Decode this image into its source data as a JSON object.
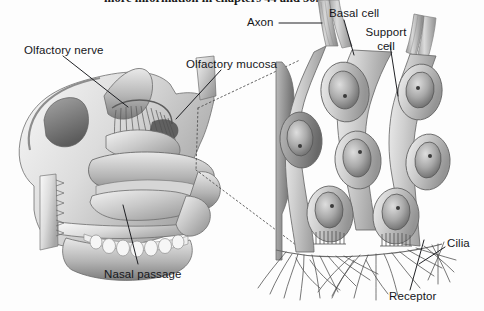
{
  "figure": {
    "title_partial": "more information in chapters 44 and 50.",
    "background_color": "#fdfdfd",
    "ink_color": "#15161a",
    "width": 484,
    "height": 311
  },
  "panels": {
    "left": {
      "name": "sagittal-nasal-cavity",
      "description": "Grayscale sagittal section of the human nasal cavity showing nasal septum, turbinates, olfactory bulb region, hard palate and upper teeth."
    },
    "right": {
      "name": "olfactory-epithelium-detail",
      "description": "Magnified grayscale drawing of olfactory epithelium: elongated support cells, basal cells, receptor neurons with nuclei, axons exiting the top and cilia extending at the bottom."
    },
    "connector": {
      "name": "magnification-cone",
      "style": "dotted"
    }
  },
  "labels": [
    {
      "id": "olfactory-nerve",
      "text": "Olfactory nerve",
      "x": 24,
      "y": 44
    },
    {
      "id": "olfactory-mucosa",
      "text": "Olfactory mucosa",
      "x": 186,
      "y": 58
    },
    {
      "id": "nasal-passage",
      "text": "Nasal passage",
      "x": 104,
      "y": 268
    },
    {
      "id": "axon",
      "text": "Axon",
      "x": 247,
      "y": 27
    },
    {
      "id": "basal-cell",
      "text": "Basal cell",
      "x": 329,
      "y": 7
    },
    {
      "id": "support-cell",
      "line1": "Support",
      "line2": "cell",
      "x": 360,
      "y": 26
    },
    {
      "id": "cilia",
      "text": "Cilia",
      "x": 447,
      "y": 243
    },
    {
      "id": "receptor",
      "text": "Receptor",
      "x": 389,
      "y": 296
    }
  ],
  "leader_lines": [
    {
      "id": "leader-olfactory-nerve",
      "from": [
        63,
        56
      ],
      "to": [
        128,
        107
      ]
    },
    {
      "id": "leader-olfactory-mucosa",
      "from": [
        221,
        70
      ],
      "to": [
        176,
        119
      ]
    },
    {
      "id": "leader-nasal-passage",
      "from": [
        138,
        264
      ],
      "to": [
        123,
        205
      ]
    },
    {
      "id": "leader-axon",
      "from": [
        279,
        23
      ],
      "to": [
        322,
        23
      ]
    },
    {
      "id": "leader-basal-cell",
      "from": [
        344,
        20
      ],
      "to": [
        354,
        55
      ]
    },
    {
      "id": "leader-support-cell",
      "from": [
        390,
        45
      ],
      "to": [
        398,
        96
      ]
    },
    {
      "id": "leader-cilia",
      "from": [
        445,
        247
      ],
      "to": [
        419,
        264
      ]
    },
    {
      "id": "leader-receptor",
      "from": [
        410,
        290
      ],
      "to": [
        424,
        240
      ]
    }
  ]
}
